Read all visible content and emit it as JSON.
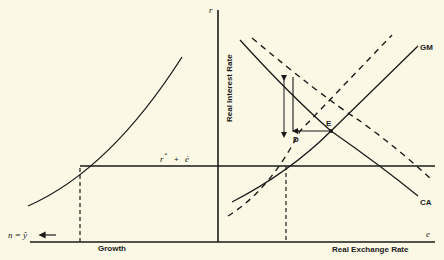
{
  "diagram": {
    "type": "economics-two-panel",
    "axes": {
      "vertical_symbol": "r",
      "vertical_label": "Real Interest Rate",
      "horizontal_symbol": "e",
      "horizontal_label": "Real Exchange Rate",
      "left_label": "Growth",
      "left_symbol": "n = ŷ"
    },
    "curves": {
      "gm_label": "GM",
      "ca_label": "CA"
    },
    "lines": {
      "world_rate_label_r": "r",
      "world_rate_label_star": "*",
      "world_rate_label_plus": "+",
      "world_rate_label_e": "ė"
    },
    "points": {
      "equilibrium": "E",
      "adjusted": "D"
    },
    "colors": {
      "background": "#fbf9e6",
      "ink": "#1a1a1a"
    }
  }
}
